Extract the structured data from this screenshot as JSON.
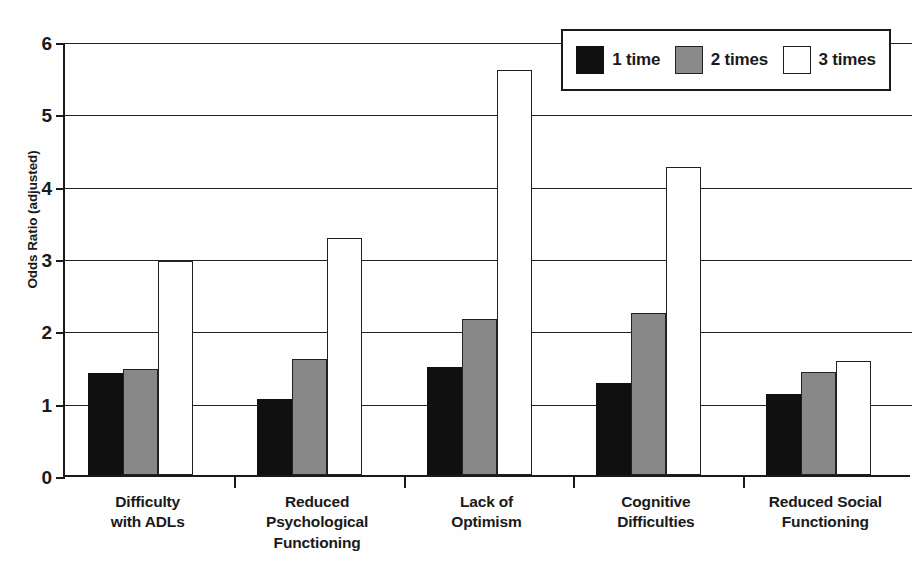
{
  "chart_data": {
    "type": "bar",
    "title": "",
    "xlabel": "",
    "ylabel": "Odds Ratio (adjusted)",
    "ylim": [
      0,
      6
    ],
    "yticks": [
      0,
      1,
      2,
      3,
      4,
      5,
      6
    ],
    "ytick_labels": [
      "0",
      "1",
      "2",
      "3",
      "4",
      "5",
      "6"
    ],
    "grid": true,
    "legend_position": "top-right",
    "categories": [
      "Difficulty\nwith ADLs",
      "Reduced\nPsychological\nFunctioning",
      "Lack of\nOptimism",
      "Cognitive\nDifficulties",
      "Reduced Social\nFunctioning"
    ],
    "category_lines": [
      [
        "Difficulty",
        "with ADLs"
      ],
      [
        "Reduced",
        "Psychological",
        "Functioning"
      ],
      [
        "Lack of",
        "Optimism"
      ],
      [
        "Cognitive",
        "Difficulties"
      ],
      [
        "Reduced Social",
        "Functioning"
      ]
    ],
    "series": [
      {
        "name": "1 time",
        "color": "#101010",
        "values": [
          1.41,
          1.05,
          1.5,
          1.27,
          1.12
        ]
      },
      {
        "name": "2 times",
        "color": "#8a8a8a",
        "values": [
          1.46,
          1.6,
          2.15,
          2.24,
          1.43
        ]
      },
      {
        "name": "3 times",
        "color": "#ffffff",
        "values": [
          2.96,
          3.27,
          5.6,
          4.26,
          1.57
        ]
      }
    ]
  },
  "legend": {
    "items": [
      {
        "label": "1 time",
        "swatch": "black-swatch"
      },
      {
        "label": "2 times",
        "swatch": "gray-swatch"
      },
      {
        "label": "3 times",
        "swatch": "white-swatch"
      }
    ]
  },
  "axes": {
    "y_label": "Odds Ratio (adjusted)"
  }
}
